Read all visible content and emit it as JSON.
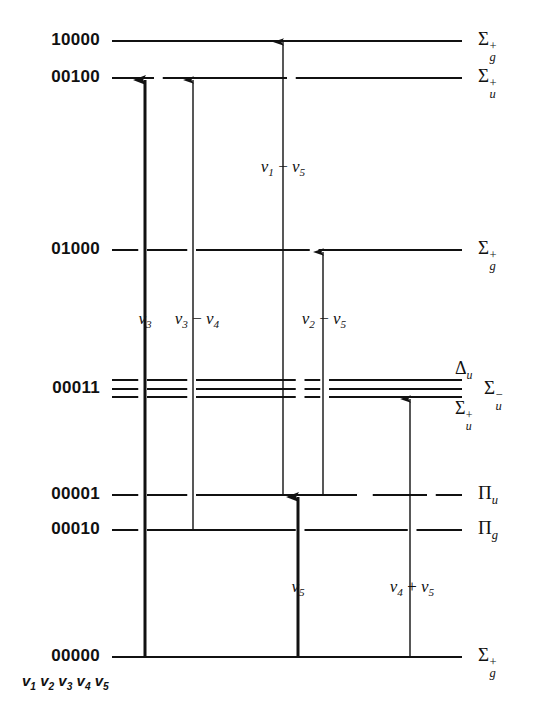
{
  "figure": {
    "type": "energy-level-diagram",
    "title": "",
    "molecule_caption": "v1 v2 v3 v4 v5",
    "background": "#ffffff",
    "line_color": "#111111"
  },
  "levels": [
    {
      "id": "10000",
      "label": "10000",
      "term_main": "Σ",
      "term_sup": "+",
      "term_sub": "g",
      "y": 41,
      "multiplet": false
    },
    {
      "id": "00100",
      "label": "00100",
      "term_main": "Σ",
      "term_sup": "+",
      "term_sub": "u",
      "y": 78,
      "multiplet": false
    },
    {
      "id": "01000",
      "label": "01000",
      "term_main": "Σ",
      "term_sup": "+",
      "term_sub": "g",
      "y": 250,
      "multiplet": false
    },
    {
      "id": "00011",
      "label": "00011",
      "term_main": "",
      "term_sup": "",
      "term_sub": "",
      "y": 389,
      "multiplet": true
    },
    {
      "id": "00001",
      "label": "00001",
      "term_main": "Π",
      "term_sup": "",
      "term_sub": "u",
      "y": 495,
      "multiplet": false
    },
    {
      "id": "00010",
      "label": "00010",
      "term_main": "Π",
      "term_sup": "",
      "term_sub": "g",
      "y": 530,
      "multiplet": false
    },
    {
      "id": "00000",
      "label": "00000",
      "term_main": "Σ",
      "term_sup": "+",
      "term_sub": "g",
      "y": 657,
      "multiplet": false
    }
  ],
  "multiplet_terms": [
    {
      "id": "delta-u",
      "main": "Δ",
      "sup": "",
      "sub": "u",
      "y": 372,
      "x": 455,
      "anchor": "above"
    },
    {
      "id": "sigma-u-minus",
      "main": "Σ",
      "sup": "−",
      "sub": "u",
      "y": 389,
      "x": 484,
      "anchor": "right"
    },
    {
      "id": "sigma-u-plus",
      "main": "Σ",
      "sup": "+",
      "sub": "u",
      "y": 410,
      "x": 455,
      "anchor": "below"
    }
  ],
  "transitions": [
    {
      "id": "nu3",
      "label_html": "<i>ν</i><sub>3</sub>",
      "label_x": 145,
      "label_y": 320,
      "x": 145,
      "from_y": 657,
      "to_y": 80,
      "weight": "thick"
    },
    {
      "id": "nu3-nu4",
      "label_html": "<i>ν</i><sub>3</sub> − <i>ν</i><sub>4</sub>",
      "label_x": 197,
      "label_y": 320,
      "x": 193,
      "from_y": 530,
      "to_y": 80,
      "weight": "thin"
    },
    {
      "id": "nu1-nu5",
      "label_html": "<i>ν</i><sub>1</sub> − <i>ν</i><sub>5</sub>",
      "label_x": 283,
      "label_y": 168,
      "x": 283,
      "from_y": 495,
      "to_y": 42,
      "weight": "thin"
    },
    {
      "id": "nu2-nu5",
      "label_html": "<i>ν</i><sub>2</sub> − <i>ν</i><sub>5</sub>",
      "label_x": 324,
      "label_y": 320,
      "x": 323,
      "from_y": 495,
      "to_y": 252,
      "weight": "thin"
    },
    {
      "id": "nu5",
      "label_html": "<i>ν</i><sub>5</sub>",
      "label_x": 298,
      "label_y": 588,
      "x": 298,
      "from_y": 657,
      "to_y": 497,
      "weight": "thick"
    },
    {
      "id": "nu4-plus-nu5",
      "label_html": "<i>ν</i><sub>4</sub> + <i>ν</i><sub>5</sub>",
      "label_x": 412,
      "label_y": 588,
      "x": 410,
      "from_y": 657,
      "to_y": 399,
      "weight": "thin"
    }
  ],
  "axis": {
    "line_left": 112,
    "line_right": 462,
    "label_right_edge": 100,
    "term_left": 478
  },
  "chart_data": {
    "type": "diagram",
    "level_labels": [
      "10000",
      "00100",
      "01000",
      "00011",
      "00001",
      "00010",
      "00000"
    ],
    "term_symbols": [
      "Σg+",
      "Σu+",
      "Σg+",
      "Δu / Σu− / Σu+",
      "Πu",
      "Πg",
      "Σg+"
    ],
    "transition_labels": [
      "ν3",
      "ν3 − ν4",
      "ν1 − ν5",
      "ν2 − ν5",
      "ν5",
      "ν4 + ν5"
    ],
    "bottom_caption": "v1 v2 v3 v4 v5"
  }
}
